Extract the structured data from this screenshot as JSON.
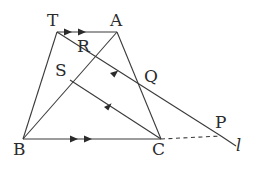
{
  "figure": {
    "type": "geometry-diagram",
    "width": 254,
    "height": 176,
    "background": "#ffffff",
    "stroke_color": "#3a3a3a",
    "label_color": "#2b2b2b"
  },
  "points": {
    "T": {
      "label": "T",
      "x": 57,
      "y": 32,
      "label_x": 47,
      "label_y": 12
    },
    "A": {
      "label": "A",
      "x": 117,
      "y": 32,
      "label_x": 110,
      "label_y": 12
    },
    "R": {
      "label": "R",
      "x": 84,
      "y": 46,
      "label_x": 77,
      "label_y": 38
    },
    "S": {
      "label": "S",
      "x": 70,
      "y": 80,
      "label_x": 56,
      "label_y": 64
    },
    "Q": {
      "label": "Q",
      "x": 141,
      "y": 86,
      "label_x": 145,
      "label_y": 70
    },
    "B": {
      "label": "B",
      "x": 23,
      "y": 139,
      "label_x": 14,
      "label_y": 142
    },
    "C": {
      "label": "C",
      "x": 161,
      "y": 139,
      "label_x": 154,
      "label_y": 142
    },
    "P": {
      "label": "P",
      "x": 221,
      "y": 136,
      "label_x": 216,
      "label_y": 116
    },
    "l": {
      "label": "l",
      "x": 238,
      "y": 148,
      "label_x": 235,
      "label_y": 139
    }
  },
  "segments": [
    {
      "name": "segment-TA",
      "from": "T",
      "to": "A",
      "style": "solid",
      "ticks": 2,
      "tick_direction": "right"
    },
    {
      "name": "segment-BC",
      "from": "B",
      "to": "C",
      "style": "solid",
      "ticks": 2,
      "tick_direction": "right"
    },
    {
      "name": "segment-TB",
      "from": "T",
      "to": "B",
      "style": "solid",
      "ticks": 0
    },
    {
      "name": "segment-AC",
      "from": "A",
      "to": "C",
      "style": "solid",
      "ticks": 0
    },
    {
      "name": "segment-TP",
      "from": "T",
      "to": "P",
      "style": "solid",
      "ticks": 0
    },
    {
      "name": "segment-AB",
      "from": "A",
      "to": "B",
      "style": "solid",
      "ticks": 1,
      "tick_direction": "up-left"
    },
    {
      "name": "segment-QC",
      "from": "A",
      "to": "C",
      "style": "solid",
      "ticks": 0
    },
    {
      "name": "segment-CQ-extended",
      "from": "C",
      "to": "Q",
      "style": "solid",
      "ticks": 1,
      "tick_direction": "up-left"
    },
    {
      "name": "segment-CP-dashed",
      "from": "C",
      "to": "P",
      "style": "dashed",
      "ticks": 0
    },
    {
      "name": "line-l",
      "from": "P",
      "to": "l",
      "style": "solid",
      "ticks": 0
    }
  ],
  "arrow_marks": {
    "description": "parallel-direction arrowheads",
    "TA_marks": 2,
    "BC_marks": 2,
    "AB_marks": 1,
    "CQ_marks": 1
  },
  "labels_list": [
    "T",
    "A",
    "R",
    "S",
    "Q",
    "B",
    "C",
    "P",
    "l"
  ]
}
